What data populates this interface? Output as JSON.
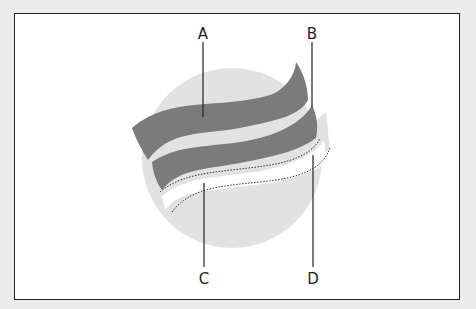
{
  "diagram": {
    "labels": [
      {
        "id": "A",
        "text": "A"
      },
      {
        "id": "B",
        "text": "B"
      },
      {
        "id": "C",
        "text": "C"
      },
      {
        "id": "D",
        "text": "D"
      }
    ],
    "colors": {
      "circle": "#e2e2e2",
      "band": "#7b7b7b",
      "frame": "#222222",
      "background": "#ececec"
    }
  }
}
